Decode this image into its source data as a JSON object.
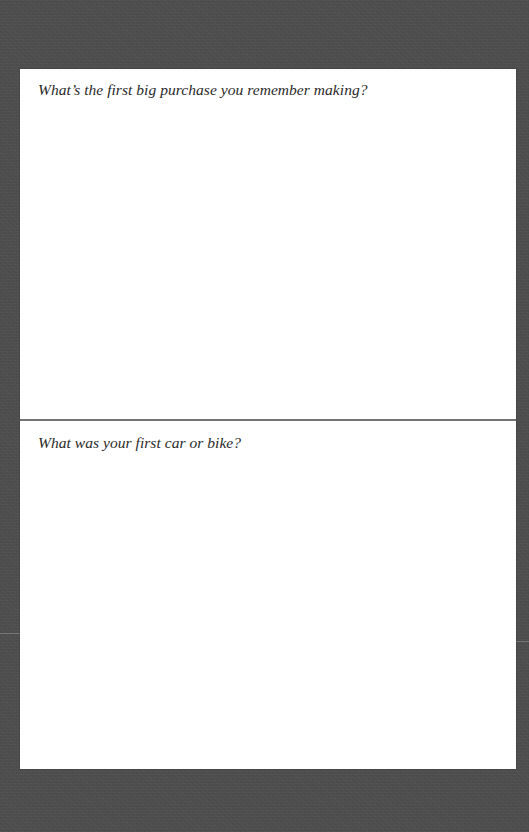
{
  "colors": {
    "background": "#4e4e4e",
    "page": "#ffffff",
    "divider": "#747474",
    "text": "#2a2a2a"
  },
  "prompts": [
    {
      "question": "What’s the first big purchase you remember making?",
      "answer": ""
    },
    {
      "question": "What was your first car or bike?",
      "answer": ""
    }
  ]
}
